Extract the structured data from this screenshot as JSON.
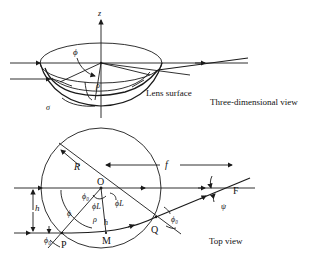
{
  "diagram": {
    "three_d_view": {
      "caption": "Three-dimensional view",
      "axis_label": "z",
      "surface_label": "Lens surface",
      "symbols": {
        "phi": "ϕ",
        "rho": "ρ",
        "sigma": "σ",
        "small_t": "t"
      }
    },
    "top_view": {
      "caption": "Top view",
      "points": {
        "O": "O",
        "P": "P",
        "Q": "Q",
        "M": "M",
        "F": "F"
      },
      "symbols": {
        "R": "R",
        "f": "f",
        "h_left": "h",
        "h_center": "h",
        "phi": "ϕ",
        "rho": "ρ",
        "phi0_O": "ϕ₀",
        "phiL_left": "ϕL",
        "phiL_right": "ϕL",
        "phi0_P": "ϕ₀",
        "phi0_Q": "ϕ₀",
        "psi": "ψ"
      }
    },
    "colors": {
      "ink": "#1a1a1a",
      "background": "#ffffff"
    }
  }
}
